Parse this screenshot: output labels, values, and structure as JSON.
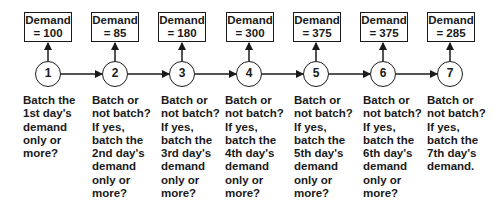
{
  "diagram": {
    "stages": [
      {
        "day": "1",
        "demand_label": "Demand",
        "demand_value": "= 100",
        "description": "Batch the\n1st day's\ndemand\nonly or\nmore?"
      },
      {
        "day": "2",
        "demand_label": "Demand",
        "demand_value": "= 85",
        "description": "Batch or\nnot batch?\nIf yes,\nbatch the\n2nd  day's\ndemand\nonly or\nmore?"
      },
      {
        "day": "3",
        "demand_label": "Demand",
        "demand_value": "= 180",
        "description": "Batch or\nnot batch?\nIf yes,\nbatch the\n3rd day's\ndemand\nonly or\nmore?"
      },
      {
        "day": "4",
        "demand_label": "Demand",
        "demand_value": "= 300",
        "description": "Batch or\nnot batch?\nIf yes,\nbatch the\n4th day's\ndemand\nonly or\nmore?"
      },
      {
        "day": "5",
        "demand_label": "Demand",
        "demand_value": "= 375",
        "description": "Batch or\nnot batch?\nIf yes,\nbatch the\n5th day's\ndemand\nonly or\nmore?"
      },
      {
        "day": "6",
        "demand_label": "Demand",
        "demand_value": "= 375",
        "description": "Batch or\nnot batch?\nIf yes,\n batch the\n6th day's\ndemand\nonly or\nmore?"
      },
      {
        "day": "7",
        "demand_label": "Demand",
        "demand_value": "= 285",
        "description": "Batch or\nnot batch?\nIf yes,\nbatch the\n7th day's\ndemand."
      }
    ],
    "colors": {
      "stroke": "#1a1a1a",
      "background": "#ffffff"
    }
  }
}
